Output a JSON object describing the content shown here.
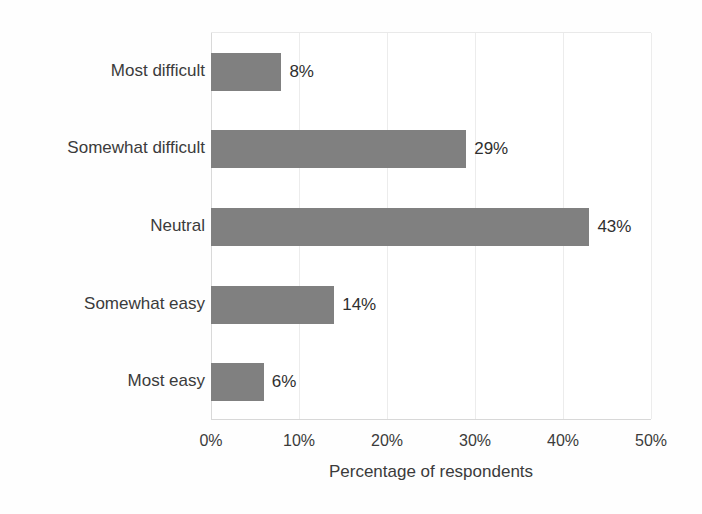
{
  "chart_data": {
    "type": "bar",
    "orientation": "horizontal",
    "title": "",
    "xlabel": "Percentage of respondents",
    "ylabel": "",
    "xlim": [
      0,
      50
    ],
    "xtick_labels": [
      "0%",
      "10%",
      "20%",
      "30%",
      "40%",
      "50%"
    ],
    "xticks": [
      0,
      10,
      20,
      30,
      40,
      50
    ],
    "grid": true,
    "legend": false,
    "bar_color": "#808080",
    "categories": [
      "Most difficult",
      "Somewhat difficult",
      "Neutral",
      "Somewhat easy",
      "Most easy"
    ],
    "values": [
      8,
      29,
      43,
      14,
      6
    ],
    "data_labels": [
      "8%",
      "29%",
      "43%",
      "14%",
      "6%"
    ]
  }
}
